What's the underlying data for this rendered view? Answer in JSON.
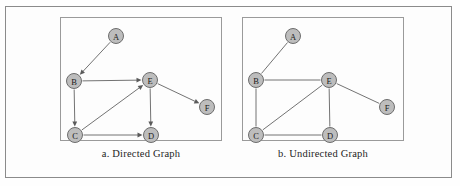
{
  "figure": {
    "background_color": "#fdfdfd",
    "frame_color": "#8b8b8b",
    "node_fill": "#bdbdbd",
    "node_stroke": "#6d6d6d",
    "edge_color": "#737373"
  },
  "panels": [
    {
      "id": "directed",
      "caption": "a. Directed Graph",
      "box": {
        "left": 60,
        "top": 17,
        "width": 162,
        "height": 124
      },
      "caption_top": 148,
      "directed": true,
      "nodes": [
        {
          "id": "A",
          "label": "A",
          "x": 56,
          "y": 19
        },
        {
          "id": "B",
          "label": "B",
          "x": 14,
          "y": 64
        },
        {
          "id": "C",
          "label": "C",
          "x": 15,
          "y": 118
        },
        {
          "id": "D",
          "label": "D",
          "x": 91,
          "y": 118
        },
        {
          "id": "E",
          "label": "E",
          "x": 90,
          "y": 63
        },
        {
          "id": "F",
          "label": "F",
          "x": 147,
          "y": 90
        }
      ],
      "edges": [
        {
          "from": "A",
          "to": "B"
        },
        {
          "from": "B",
          "to": "E"
        },
        {
          "from": "B",
          "to": "C"
        },
        {
          "from": "C",
          "to": "E"
        },
        {
          "from": "C",
          "to": "D"
        },
        {
          "from": "E",
          "to": "D"
        },
        {
          "from": "E",
          "to": "F"
        }
      ]
    },
    {
      "id": "undirected",
      "caption": "b. Undirected Graph",
      "box": {
        "left": 242,
        "top": 17,
        "width": 162,
        "height": 124
      },
      "caption_top": 148,
      "directed": false,
      "nodes": [
        {
          "id": "A",
          "label": "A",
          "x": 51,
          "y": 19
        },
        {
          "id": "B",
          "label": "B",
          "x": 14,
          "y": 63
        },
        {
          "id": "C",
          "label": "C",
          "x": 14,
          "y": 118
        },
        {
          "id": "D",
          "label": "D",
          "x": 88,
          "y": 118
        },
        {
          "id": "E",
          "label": "E",
          "x": 87,
          "y": 63
        },
        {
          "id": "F",
          "label": "F",
          "x": 145,
          "y": 90
        }
      ],
      "edges": [
        {
          "from": "A",
          "to": "B"
        },
        {
          "from": "B",
          "to": "E"
        },
        {
          "from": "B",
          "to": "C"
        },
        {
          "from": "C",
          "to": "E"
        },
        {
          "from": "C",
          "to": "D"
        },
        {
          "from": "E",
          "to": "D"
        },
        {
          "from": "E",
          "to": "F"
        }
      ]
    }
  ],
  "node_radius": 7.5
}
